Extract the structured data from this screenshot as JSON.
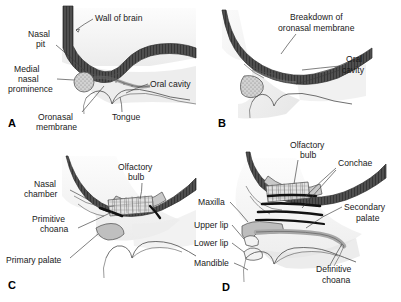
{
  "figure": {
    "background_color": "#ffffff",
    "text_color": "#1a1a1a",
    "leader_color": "#3a3a3a"
  },
  "palette": {
    "brain_wall_dark": "#4a4a4a",
    "brain_wall_hatch": "#2b2b2b",
    "tissue_light": "#f0f0f0",
    "tissue_mid": "#d8d8d8",
    "tissue_shadow": "#c4c4c4",
    "bone_gray": "#b8b8b8",
    "concha_black": "#111111",
    "outline": "#4a4a4a"
  },
  "panels": [
    {
      "id": "A",
      "letter": "A",
      "labels": [
        {
          "name": "wall-of-brain",
          "text": "Wall of brain",
          "line1": "Wall of brain",
          "line2": ""
        },
        {
          "name": "nasal-pit",
          "text": "Nasal pit",
          "line1": "Nasal",
          "line2": "pit"
        },
        {
          "name": "medial-nasal-prominence",
          "text": "Medial nasal prominence",
          "line1": "Medial",
          "line2": "nasal",
          "line3": "prominence"
        },
        {
          "name": "oral-cavity",
          "text": "Oral cavity",
          "line1": "Oral cavity",
          "line2": ""
        },
        {
          "name": "oronasal-membrane",
          "text": "Oronasal membrane",
          "line1": "Oronasal",
          "line2": "membrane"
        },
        {
          "name": "tongue",
          "text": "Tongue",
          "line1": "Tongue",
          "line2": ""
        }
      ]
    },
    {
      "id": "B",
      "letter": "B",
      "labels": [
        {
          "name": "breakdown-of-oronasal-membrane",
          "text": "Breakdown of oronasal membrane",
          "line1": "Breakdown of",
          "line2": "oronasal membrane"
        },
        {
          "name": "oral-cavity",
          "text": "Oral cavity",
          "line1": "Oral",
          "line2": "cavity"
        }
      ]
    },
    {
      "id": "C",
      "letter": "C",
      "labels": [
        {
          "name": "olfactory-bulb",
          "text": "Olfactory bulb",
          "line1": "Olfactory",
          "line2": "bulb"
        },
        {
          "name": "nasal-chamber",
          "text": "Nasal chamber",
          "line1": "Nasal",
          "line2": "chamber"
        },
        {
          "name": "primitive-choana",
          "text": "Primitive choana",
          "line1": "Primitive",
          "line2": "choana"
        },
        {
          "name": "primary-palate",
          "text": "Primary palate",
          "line1": "Primary palate",
          "line2": ""
        }
      ]
    },
    {
      "id": "D",
      "letter": "D",
      "labels": [
        {
          "name": "olfactory-bulb",
          "text": "Olfactory bulb",
          "line1": "Olfactory",
          "line2": "bulb"
        },
        {
          "name": "conchae",
          "text": "Conchae",
          "line1": "Conchae",
          "line2": ""
        },
        {
          "name": "maxilla",
          "text": "Maxilla",
          "line1": "Maxilla",
          "line2": ""
        },
        {
          "name": "secondary-palate",
          "text": "Secondary palate",
          "line1": "Secondary",
          "line2": "palate"
        },
        {
          "name": "upper-lip",
          "text": "Upper lip",
          "line1": "Upper lip",
          "line2": ""
        },
        {
          "name": "lower-lip",
          "text": "Lower lip",
          "line1": "Lower lip",
          "line2": ""
        },
        {
          "name": "mandible",
          "text": "Mandible",
          "line1": "Mandible",
          "line2": ""
        },
        {
          "name": "definitive-choana",
          "text": "Definitive choana",
          "line1": "Definitive",
          "line2": "choana"
        }
      ]
    }
  ],
  "panelA": {
    "letter": "A",
    "wall_of_brain": "Wall of brain",
    "nasal_1": "Nasal",
    "nasal_2": "pit",
    "medial_1": "Medial",
    "medial_2": "nasal",
    "medial_3": "prominence",
    "oral_cavity": "Oral cavity",
    "oronasal_1": "Oronasal",
    "oronasal_2": "membrane",
    "tongue": "Tongue"
  },
  "panelB": {
    "letter": "B",
    "breakdown_1": "Breakdown of",
    "breakdown_2": "oronasal membrane",
    "oral_1": "Oral",
    "oral_2": "cavity"
  },
  "panelC": {
    "letter": "C",
    "olfactory_1": "Olfactory",
    "olfactory_2": "bulb",
    "nasal_1": "Nasal",
    "nasal_2": "chamber",
    "primitive_1": "Primitive",
    "primitive_2": "choana",
    "primary_palate": "Primary palate"
  },
  "panelD": {
    "letter": "D",
    "olfactory_1": "Olfactory",
    "olfactory_2": "bulb",
    "conchae": "Conchae",
    "maxilla": "Maxilla",
    "secondary_1": "Secondary",
    "secondary_2": "palate",
    "upper_lip": "Upper lip",
    "lower_lip": "Lower lip",
    "mandible": "Mandible",
    "definitive_1": "Definitive",
    "definitive_2": "choana"
  }
}
